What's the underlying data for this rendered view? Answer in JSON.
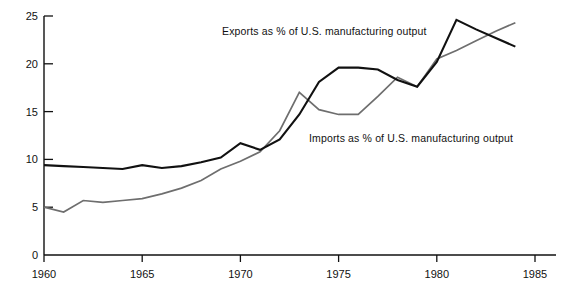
{
  "chart_data": {
    "type": "line",
    "title": "",
    "xlabel": "",
    "ylabel": "",
    "xlim": [
      1959,
      1985
    ],
    "ylim": [
      0,
      25
    ],
    "grid": false,
    "legend_position": "inline-annotations",
    "xticks": [
      1960,
      1965,
      1970,
      1975,
      1980,
      1985
    ],
    "xtick_labels": [
      "1960",
      "1965",
      "1970",
      "1975",
      "1980",
      "1985"
    ],
    "yticks": [
      0,
      5,
      10,
      15,
      20,
      25
    ],
    "ytick_labels": [
      "0",
      "5",
      "10",
      "15",
      "20",
      "25"
    ],
    "annotations": [
      {
        "name": "exports-annotation",
        "text": "Exports as % of U.S. manufacturing output"
      },
      {
        "name": "imports-annotation",
        "text": "Imports as % of U.S. manufacturing output"
      }
    ],
    "x": [
      1960,
      1961,
      1962,
      1963,
      1964,
      1965,
      1966,
      1967,
      1968,
      1969,
      1970,
      1971,
      1972,
      1973,
      1974,
      1975,
      1976,
      1977,
      1978,
      1979,
      1980,
      1981,
      1982,
      1983,
      1984
    ],
    "series": [
      {
        "name": "Exports as % of U.S. manufacturing output",
        "color": "#111111",
        "width": 2.1,
        "values": [
          9.4,
          9.3,
          9.2,
          9.1,
          9.0,
          9.4,
          9.1,
          9.3,
          9.7,
          10.2,
          11.7,
          11.0,
          12.1,
          14.7,
          18.1,
          19.6,
          19.6,
          19.4,
          18.3,
          17.6,
          20.2,
          24.6,
          23.6,
          22.7,
          21.8
        ]
      },
      {
        "name": "Imports as % of U.S. manufacturing output",
        "color": "#6e6e6e",
        "width": 1.7,
        "values": [
          5.0,
          4.5,
          5.7,
          5.5,
          5.7,
          5.9,
          6.4,
          7.0,
          7.8,
          9.0,
          9.8,
          10.8,
          13.0,
          17.0,
          15.2,
          14.7,
          14.7,
          16.6,
          18.6,
          17.6,
          20.5,
          21.4,
          22.4,
          23.4,
          24.3
        ]
      }
    ]
  }
}
